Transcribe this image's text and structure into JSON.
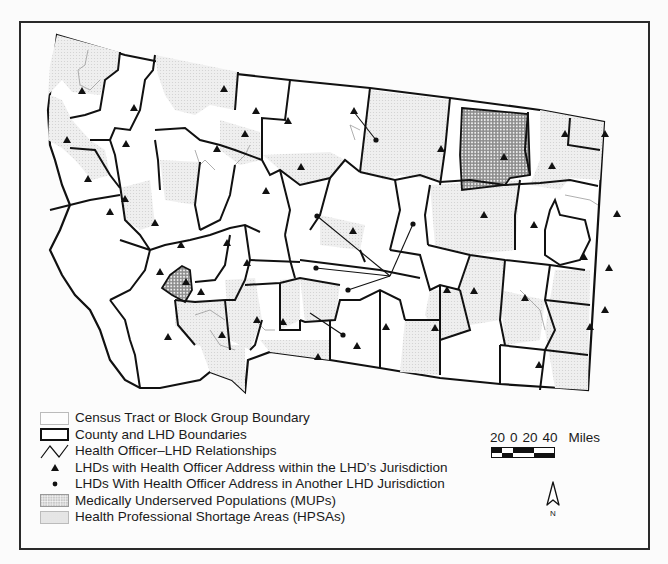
{
  "map": {
    "region": "Montana",
    "frame": {
      "left": 19,
      "top": 21,
      "right": 650,
      "bottom": 550
    },
    "colors": {
      "boundary": "#111111",
      "tract_line": "#9a9a9a",
      "hpsa_fill": "#ececec",
      "mup_fill": "#9c9c9c",
      "background": "#fcfcfc"
    }
  },
  "legend": {
    "items": [
      {
        "symbol": "thin-rectangle",
        "label": "Census Tract or Block Group Boundary"
      },
      {
        "symbol": "thick-rectangle",
        "label": "County and LHD Boundaries"
      },
      {
        "symbol": "zigzag-line",
        "label": "Health Officer–LHD Relationships"
      },
      {
        "symbol": "triangle",
        "label": "LHDs with Health Officer Address within the LHD’s Jurisdiction"
      },
      {
        "symbol": "dot",
        "label": "LHDs With Health Officer Address in Another LHD Jurisdiction"
      },
      {
        "symbol": "dense-dot-pattern",
        "label": "Medically Underserved Populations (MUPs)"
      },
      {
        "symbol": "light-stipple",
        "label": "Health Professional Shortage Areas (HPSAs)"
      }
    ]
  },
  "scale_bar": {
    "ticks": [
      "20",
      "0",
      "20",
      "40"
    ],
    "unit": "Miles"
  },
  "north_arrow": {
    "label": "N"
  }
}
